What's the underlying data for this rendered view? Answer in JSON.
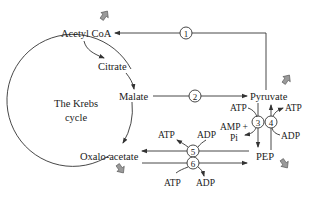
{
  "diagram": {
    "cycle_label_line1": "The Krebs",
    "cycle_label_line2": "cycle",
    "nodes": {
      "acetyl_coa": "Acetyl CoA",
      "citrate": "Citrate",
      "malate": "Malate",
      "oxaloacetate": "Oxalo-acetate",
      "pyruvate": "Pyruvate",
      "pep": "PEP"
    },
    "enzymes": [
      "1",
      "2",
      "3",
      "4",
      "5",
      "6"
    ],
    "cofactors": {
      "e3_in": "ATP",
      "e3_out_line1": "AMP +",
      "e3_out_line2": "Pi",
      "e4_out": "ATP",
      "e4_in": "ADP",
      "e5_out": "ATP",
      "e5_in": "ADP",
      "e6_in": "ATP",
      "e6_out": "ADP"
    },
    "edges": [
      {
        "from": "Pyruvate",
        "to": "Acetyl CoA",
        "enzyme": "1"
      },
      {
        "from": "Malate",
        "to": "Pyruvate",
        "enzyme": "2"
      },
      {
        "from": "Pyruvate",
        "to": "PEP",
        "enzyme": "3"
      },
      {
        "from": "PEP",
        "to": "Pyruvate",
        "enzyme": "4"
      },
      {
        "from": "PEP",
        "to": "Oxalo-acetate",
        "enzyme": "5"
      },
      {
        "from": "Oxalo-acetate",
        "to": "PEP",
        "enzyme": "6"
      }
    ],
    "indicator_arrows": [
      {
        "near": "Acetyl CoA",
        "direction": "up"
      },
      {
        "near": "Pyruvate",
        "direction": "up"
      },
      {
        "near": "Oxalo-acetate",
        "direction": "down"
      },
      {
        "near": "PEP",
        "direction": "down"
      }
    ],
    "colors": {
      "line": "#333333",
      "indicator_arrow": "#8a8a8a"
    }
  }
}
